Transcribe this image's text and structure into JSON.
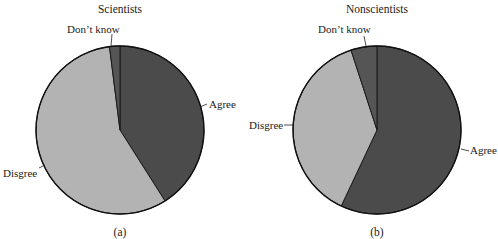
{
  "chart_data": [
    {
      "type": "pie",
      "title": "Scientists",
      "caption": "(a)",
      "categories": [
        "Agree",
        "Disgree",
        "Don't know"
      ],
      "values": [
        41,
        57,
        2
      ],
      "start_angle_deg": 0,
      "direction": "clockwise",
      "colors": [
        "#4b4b4b",
        "#b3b3b3",
        "#555555"
      ]
    },
    {
      "type": "pie",
      "title": "Nonscientists",
      "caption": "(b)",
      "categories": [
        "Agree",
        "Disgree",
        "Don't know"
      ],
      "values": [
        57,
        38,
        5
      ],
      "start_angle_deg": 0,
      "direction": "clockwise",
      "colors": [
        "#4b4b4b",
        "#b3b3b3",
        "#555555"
      ]
    }
  ],
  "pies": [
    {
      "title": "Scientists",
      "caption": "(a)",
      "labels": {
        "agree": "Agree",
        "disagree": "Disgree",
        "dontknow": "Don’t know"
      }
    },
    {
      "title": "Nonscientists",
      "caption": "(b)",
      "labels": {
        "agree": "Agree",
        "disagree": "Disgree",
        "dontknow": "Don’t know"
      }
    }
  ]
}
